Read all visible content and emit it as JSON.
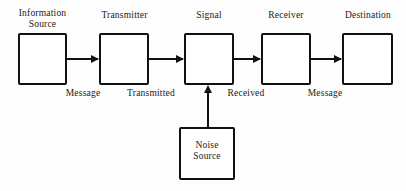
{
  "diagram": {
    "background_color": "#fdfdfd",
    "stroke_color": "#111111",
    "text_color": "#1a1a1a",
    "nodes": [
      {
        "id": "information-source",
        "title": "Information\nSource",
        "inner_text": ""
      },
      {
        "id": "transmitter",
        "title": "Transmitter",
        "inner_text": ""
      },
      {
        "id": "signal",
        "title": "Signal",
        "inner_text": ""
      },
      {
        "id": "receiver",
        "title": "Receiver",
        "inner_text": ""
      },
      {
        "id": "destination",
        "title": "Destination",
        "inner_text": ""
      },
      {
        "id": "noise-source",
        "title": "",
        "inner_text": "Noise\nSource"
      }
    ],
    "edge_labels": [
      {
        "id": "message-1",
        "text": "Message"
      },
      {
        "id": "transmitted",
        "text": "Transmitted"
      },
      {
        "id": "received",
        "text": "Received"
      },
      {
        "id": "message-2",
        "text": "Message"
      }
    ]
  }
}
